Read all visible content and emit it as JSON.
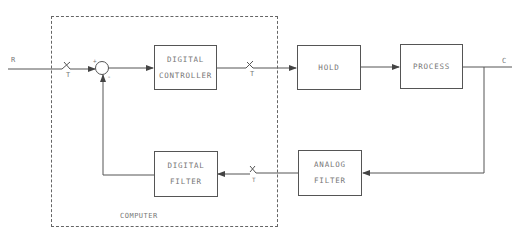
{
  "diagram": {
    "type": "block-diagram",
    "signals": {
      "input": "R",
      "output": "C"
    },
    "computer_boundary": {
      "label": "COMPUTER"
    },
    "blocks": [
      {
        "id": "digital_controller",
        "line1": "DIGITAL",
        "line2": "CONTROLLER"
      },
      {
        "id": "hold",
        "line1": "HOLD",
        "line2": ""
      },
      {
        "id": "process",
        "line1": "PROCESS",
        "line2": ""
      },
      {
        "id": "analog_filter",
        "line1": "ANALOG",
        "line2": "FILTER"
      },
      {
        "id": "digital_filter",
        "line1": "DIGITAL",
        "line2": "FILTER"
      }
    ],
    "samplers": [
      {
        "id": "input_sampler",
        "label": "T"
      },
      {
        "id": "controller_output_sampler",
        "label": "T"
      },
      {
        "id": "feedback_sampler",
        "label": "T"
      }
    ],
    "summing_junction": {
      "plus": "+",
      "minus": "-"
    },
    "connections": [
      [
        "R",
        "input_sampler"
      ],
      [
        "input_sampler",
        "summing_junction"
      ],
      [
        "summing_junction",
        "digital_controller"
      ],
      [
        "digital_controller",
        "controller_output_sampler"
      ],
      [
        "controller_output_sampler",
        "hold"
      ],
      [
        "hold",
        "process"
      ],
      [
        "process",
        "C"
      ],
      [
        "C",
        "analog_filter"
      ],
      [
        "analog_filter",
        "feedback_sampler"
      ],
      [
        "feedback_sampler",
        "digital_filter"
      ],
      [
        "digital_filter",
        "summing_junction"
      ]
    ],
    "colors": {
      "line": "#555555",
      "text": "#777777",
      "background": "#ffffff"
    }
  }
}
